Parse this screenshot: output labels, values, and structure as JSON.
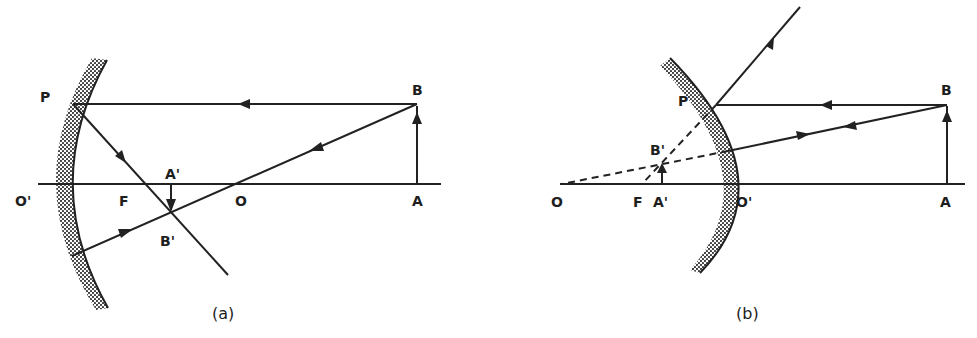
{
  "figure": {
    "colors": {
      "ink": "#222222",
      "background": "#ffffff"
    }
  },
  "panel_a": {
    "caption": "(a)",
    "mirror_type": "concave",
    "labels": {
      "P": "P",
      "B": "B",
      "O_prime": "O'",
      "F": "F",
      "A_prime": "A'",
      "O": "O",
      "A": "A",
      "B_prime": "B'"
    }
  },
  "panel_b": {
    "caption": "(b)",
    "mirror_type": "convex",
    "labels": {
      "P": "P",
      "B": "B",
      "B_prime": "B'",
      "O": "O",
      "F": "F",
      "A_prime": "A'",
      "O_prime": "O'",
      "A": "A"
    }
  }
}
